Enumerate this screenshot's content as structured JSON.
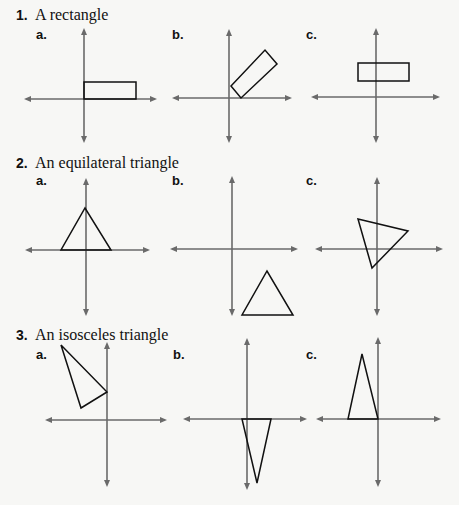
{
  "problems": [
    {
      "number": "1.",
      "title": "A rectangle",
      "parts": [
        {
          "label": "a.",
          "shape": "rectangle",
          "axes": {
            "cx": 84,
            "cy": 99,
            "xmin": 24,
            "xmax": 157,
            "ymin": 28,
            "ymax": 143
          },
          "points": [
            [
              84,
              82
            ],
            [
              136,
              82
            ],
            [
              136,
              99
            ],
            [
              84,
              99
            ]
          ]
        },
        {
          "label": "b.",
          "shape": "rectangle",
          "axes": {
            "cx": 229,
            "cy": 98,
            "xmin": 172,
            "xmax": 292,
            "ymin": 29,
            "ymax": 143
          },
          "points": [
            [
              231,
              86
            ],
            [
              241,
              98
            ],
            [
              277,
              64
            ],
            [
              265,
              50
            ]
          ]
        },
        {
          "label": "c.",
          "shape": "rectangle",
          "axes": {
            "cx": 376,
            "cy": 97,
            "xmin": 311,
            "xmax": 440,
            "ymin": 28,
            "ymax": 143
          },
          "points": [
            [
              358,
              63
            ],
            [
              409,
              63
            ],
            [
              409,
              81
            ],
            [
              358,
              81
            ]
          ]
        }
      ]
    },
    {
      "number": "2.",
      "title": "An equilateral triangle",
      "parts": [
        {
          "label": "a.",
          "shape": "triangle",
          "axes": {
            "cx": 86,
            "cy": 250,
            "xmin": 25,
            "xmax": 150,
            "ymin": 178,
            "ymax": 316
          },
          "points": [
            [
              61,
              250
            ],
            [
              111,
              250
            ],
            [
              85,
              208
            ]
          ]
        },
        {
          "label": "b.",
          "shape": "triangle",
          "axes": {
            "cx": 232,
            "cy": 249,
            "xmin": 170,
            "xmax": 298,
            "ymin": 176,
            "ymax": 316
          },
          "points": [
            [
              242,
              315
            ],
            [
              293,
              315
            ],
            [
              267,
              271
            ]
          ]
        },
        {
          "label": "c.",
          "shape": "triangle",
          "axes": {
            "cx": 377,
            "cy": 249,
            "xmin": 315,
            "xmax": 443,
            "ymin": 177,
            "ymax": 316
          },
          "points": [
            [
              358,
              219
            ],
            [
              408,
              231
            ],
            [
              372,
              268
            ]
          ]
        }
      ]
    },
    {
      "number": "3.",
      "title": "An isosceles triangle",
      "parts": [
        {
          "label": "a.",
          "shape": "triangle",
          "axes": {
            "cx": 107,
            "cy": 420,
            "xmin": 45,
            "xmax": 167,
            "ymin": 342,
            "ymax": 487
          },
          "points": [
            [
              61,
              345
            ],
            [
              107,
              392
            ],
            [
              81,
              408
            ]
          ]
        },
        {
          "label": "b.",
          "shape": "triangle",
          "axes": {
            "cx": 247,
            "cy": 419,
            "xmin": 183,
            "xmax": 307,
            "ymin": 338,
            "ymax": 490
          },
          "points": [
            [
              242,
              419
            ],
            [
              271,
              419
            ],
            [
              257,
              483
            ]
          ]
        },
        {
          "label": "c.",
          "shape": "triangle",
          "axes": {
            "cx": 378,
            "cy": 419,
            "xmin": 316,
            "xmax": 441,
            "ymin": 337,
            "ymax": 487
          },
          "points": [
            [
              348,
              419
            ],
            [
              378,
              419
            ],
            [
              362,
              354
            ]
          ]
        }
      ]
    }
  ]
}
